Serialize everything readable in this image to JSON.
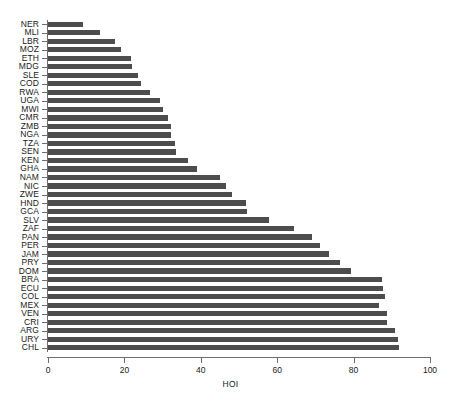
{
  "chart_data": {
    "type": "bar",
    "orientation": "horizontal",
    "title": "",
    "xlabel": "HOI",
    "ylabel": "",
    "xlim": [
      0,
      100
    ],
    "xticks": [
      0,
      20,
      40,
      60,
      80,
      100
    ],
    "grid": false,
    "legend": null,
    "bar_color": "#4d4d4d",
    "background_color": "#ffffff",
    "axis_color": "#6e6e6e",
    "categories": [
      "NER",
      "MLI",
      "LBR",
      "MOZ",
      "ETH",
      "MDG",
      "SLE",
      "COD",
      "RWA",
      "UGA",
      "MWI",
      "CMR",
      "ZMB",
      "NGA",
      "TZA",
      "SEN",
      "KEN",
      "GHA",
      "NAM",
      "NIC",
      "ZWE",
      "HND",
      "GCA",
      "SLV",
      "ZAF",
      "PAN",
      "PER",
      "JAM",
      "PRY",
      "DOM",
      "BRA",
      "ECU",
      "COL",
      "MEX",
      "VEN",
      "CRI",
      "ARG",
      "URY",
      "CHL"
    ],
    "values": [
      9.2,
      13.6,
      17.6,
      19.1,
      21.7,
      22.0,
      23.6,
      24.4,
      26.7,
      29.3,
      30.1,
      31.4,
      32.2,
      32.2,
      33.2,
      33.5,
      36.6,
      39.0,
      45.0,
      46.6,
      48.2,
      51.8,
      52.1,
      57.8,
      64.4,
      69.1,
      71.2,
      73.5,
      76.4,
      79.3,
      87.4,
      87.7,
      88.2,
      86.6,
      88.7,
      88.7,
      90.8,
      91.6,
      91.9
    ]
  }
}
